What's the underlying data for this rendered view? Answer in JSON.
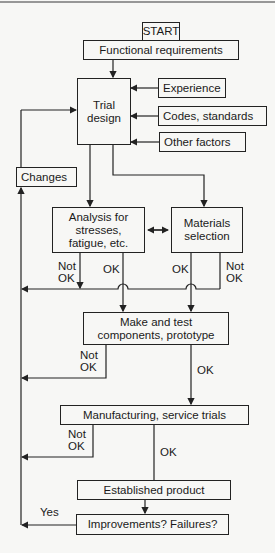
{
  "diagram": {
    "nodes": {
      "start": "START",
      "functional_requirements": "Functional requirements",
      "trial_design": "Trial design",
      "experience": "Experience",
      "codes_standards": "Codes, standards",
      "other_factors": "Other factors",
      "changes": "Changes",
      "analysis": "Analysis for stresses, fatigue, etc.",
      "materials_selection": "Materials selection",
      "make_test": "Make and test components, prototype",
      "manufacturing": "Manufacturing, service trials",
      "established_product": "Established product",
      "improvements": "Improvements? Failures?"
    },
    "edge_labels": {
      "analysis_not_ok": "Not OK",
      "analysis_ok": "OK",
      "materials_ok": "OK",
      "materials_not_ok": "Not OK",
      "make_not_ok": "Not OK",
      "make_ok": "OK",
      "manufacturing_not_ok": "Not OK",
      "manufacturing_ok": "OK",
      "improvements_yes": "Yes"
    },
    "colors": {
      "line": "#222222",
      "background": "#f7f7f5"
    }
  }
}
